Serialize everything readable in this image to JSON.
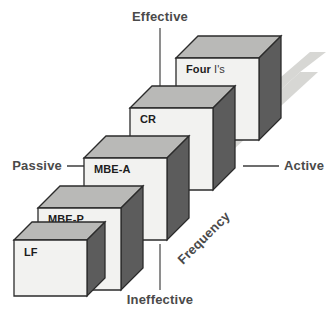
{
  "diagram": {
    "type": "isometric-staircase",
    "axes": {
      "vertical": {
        "top_label": "Effective",
        "bottom_label": "Ineffective"
      },
      "horizontal": {
        "left_label": "Passive",
        "right_label": "Active"
      },
      "depth": {
        "label": "Frequency"
      }
    },
    "cubes": [
      {
        "label": "LF",
        "label_bold": "LF",
        "label_light": "",
        "level": 1
      },
      {
        "label": "MBE-P",
        "label_bold": "MBE-P",
        "label_light": "",
        "level": 2
      },
      {
        "label": "MBE-A",
        "label_bold": "MBE-A",
        "label_light": "",
        "level": 3
      },
      {
        "label": "CR",
        "label_bold": "CR",
        "label_light": "",
        "level": 4
      },
      {
        "label": "Four I's",
        "label_bold": "Four",
        "label_light": "I's",
        "level": 5
      }
    ],
    "colors": {
      "cube_front": "#f2f2f0",
      "cube_top": "#b9b9b7",
      "cube_side": "#5c5c5c",
      "outline": "#2b2b2b",
      "ground_shadow": "#d7d7d4",
      "axis_line": "#7d7d7d",
      "label_text": "#4a4a4a",
      "background": "#ffffff"
    }
  }
}
